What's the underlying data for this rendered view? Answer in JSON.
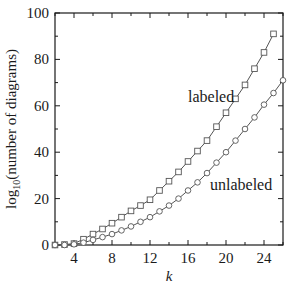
{
  "chart_data": {
    "type": "line",
    "title": "",
    "xlabel": "k",
    "ylabel": "log10(number of diagrams)",
    "ylabel_parts": {
      "prefix": "log",
      "subscript": "10",
      "suffix": "(number of diagrams)"
    },
    "xlim": [
      2,
      26
    ],
    "ylim": [
      0,
      100
    ],
    "xticks": [
      4,
      8,
      12,
      16,
      20,
      24
    ],
    "xticks_minor": [
      2,
      6,
      10,
      14,
      18,
      22,
      26
    ],
    "yticks": [
      0,
      20,
      40,
      60,
      80,
      100
    ],
    "yticks_minor": [
      10,
      30,
      50,
      70,
      90
    ],
    "grid": false,
    "legend": "none (inline annotations)",
    "series": [
      {
        "name": "labeled",
        "marker": "square",
        "x": [
          2,
          3,
          4,
          5,
          6,
          7,
          8,
          9,
          10,
          11,
          12,
          13,
          14,
          15,
          16,
          17,
          18,
          19,
          20,
          21,
          22,
          23,
          24,
          25
        ],
        "values": [
          0,
          0.2,
          0.6,
          2.5,
          4.7,
          6.9,
          9.4,
          12,
          14.7,
          17,
          19.5,
          23.5,
          27.5,
          31.5,
          36,
          40.5,
          45,
          51,
          57,
          63,
          69,
          76,
          83,
          91
        ]
      },
      {
        "name": "unlabeled",
        "marker": "circle",
        "x": [
          2,
          3,
          4,
          5,
          6,
          7,
          8,
          9,
          10,
          11,
          12,
          13,
          14,
          15,
          16,
          17,
          18,
          19,
          20,
          21,
          22,
          23,
          24,
          25,
          26
        ],
        "values": [
          0,
          0,
          0.3,
          1,
          2.2,
          3.4,
          4.7,
          6.3,
          8,
          10,
          12,
          14.5,
          17,
          20,
          23.5,
          27,
          31,
          35.5,
          40,
          45,
          50,
          55,
          60.5,
          65.5,
          71
        ]
      }
    ],
    "annotations": [
      {
        "text": "labeled",
        "x": 17.2,
        "y": 62
      },
      {
        "text": "unlabeled",
        "x": 18.9,
        "y": 23
      }
    ]
  },
  "colors": {
    "line": "#555555",
    "axis": "#1a1a1a",
    "marker_fill": "#ffffff"
  }
}
